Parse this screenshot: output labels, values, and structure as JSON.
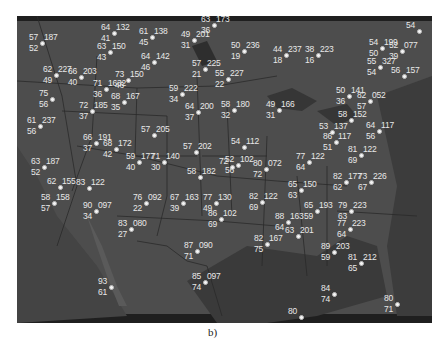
{
  "figure": {
    "caption": "b)",
    "background_color": "#4a4a4a",
    "text_color": "#e8e8e8"
  },
  "stations": [
    {
      "temp": "63",
      "pressure": "173",
      "dew": "36",
      "x": 210,
      "y": 18
    },
    {
      "temp": "57",
      "pressure": "187",
      "dew": "52",
      "x": 38,
      "y": 36
    },
    {
      "temp": "64",
      "pressure": "132",
      "dew": "41",
      "x": 110,
      "y": 26
    },
    {
      "temp": "61",
      "pressure": "138",
      "dew": "45",
      "x": 148,
      "y": 30
    },
    {
      "temp": "49",
      "pressure": "201",
      "dew": "31",
      "x": 190,
      "y": 33
    },
    {
      "temp": "63",
      "pressure": "150",
      "dew": "43",
      "x": 106,
      "y": 45
    },
    {
      "temp": "64",
      "pressure": "142",
      "dew": "46",
      "x": 150,
      "y": 55
    },
    {
      "temp": "50",
      "pressure": "236",
      "dew": "19",
      "x": 240,
      "y": 44
    },
    {
      "temp": "44",
      "pressure": "237",
      "dew": "18",
      "x": 282,
      "y": 48
    },
    {
      "temp": "38",
      "pressure": "223",
      "dew": "16",
      "x": 314,
      "y": 48
    },
    {
      "temp": "54",
      "pressure": "199",
      "dew": "50",
      "x": 378,
      "y": 41
    },
    {
      "temp": "52",
      "pressure": "077",
      "dew": "39",
      "x": 398,
      "y": 44
    },
    {
      "temp": "54",
      "pressure": "",
      "dew": "",
      "x": 415,
      "y": 24
    },
    {
      "temp": "55",
      "pressure": "327",
      "dew": "54",
      "x": 376,
      "y": 60
    },
    {
      "temp": "56",
      "pressure": "157",
      "dew": "",
      "x": 400,
      "y": 69
    },
    {
      "temp": "57",
      "pressure": "225",
      "dew": "21",
      "x": 201,
      "y": 62
    },
    {
      "temp": "55",
      "pressure": "227",
      "dew": "22",
      "x": 224,
      "y": 72
    },
    {
      "temp": "62",
      "pressure": "227",
      "dew": "49",
      "x": 52,
      "y": 68
    },
    {
      "temp": "66",
      "pressure": "203",
      "dew": "40",
      "x": 77,
      "y": 70
    },
    {
      "temp": "71",
      "pressure": "1632",
      "dew": "36",
      "x": 102,
      "y": 82
    },
    {
      "temp": "73",
      "pressure": "150",
      "dew": "46",
      "x": 124,
      "y": 73
    },
    {
      "temp": "68",
      "pressure": "167",
      "dew": "35",
      "x": 120,
      "y": 95
    },
    {
      "temp": "59",
      "pressure": "222",
      "dew": "34",
      "x": 178,
      "y": 87
    },
    {
      "temp": "64",
      "pressure": "200",
      "dew": "37",
      "x": 194,
      "y": 105
    },
    {
      "temp": "58",
      "pressure": "180",
      "dew": "32",
      "x": 230,
      "y": 103
    },
    {
      "temp": "49",
      "pressure": "166",
      "dew": "31",
      "x": 275,
      "y": 103
    },
    {
      "temp": "50",
      "pressure": "141",
      "dew": "36",
      "x": 345,
      "y": 89
    },
    {
      "temp": "82",
      "pressure": "052",
      "dew": "57",
      "x": 366,
      "y": 94
    },
    {
      "temp": "75",
      "pressure": "",
      "dew": "56",
      "x": 48,
      "y": 92
    },
    {
      "temp": "72",
      "pressure": "185",
      "dew": "37",
      "x": 88,
      "y": 104
    },
    {
      "temp": "61",
      "pressure": "237",
      "dew": "56",
      "x": 36,
      "y": 119
    },
    {
      "temp": "58",
      "pressure": "152",
      "dew": "",
      "x": 347,
      "y": 113
    },
    {
      "temp": "53",
      "pressure": "137",
      "dew": "",
      "x": 328,
      "y": 125
    },
    {
      "temp": "64",
      "pressure": "117",
      "dew": "56",
      "x": 375,
      "y": 124
    },
    {
      "temp": "86",
      "pressure": "117",
      "dew": "51",
      "x": 332,
      "y": 135
    },
    {
      "temp": "81",
      "pressure": "122",
      "dew": "69",
      "x": 357,
      "y": 148
    },
    {
      "temp": "57",
      "pressure": "205",
      "dew": "",
      "x": 150,
      "y": 128
    },
    {
      "temp": "66",
      "pressure": "191",
      "dew": "37",
      "x": 92,
      "y": 136
    },
    {
      "temp": "68",
      "pressure": "172",
      "dew": "42",
      "x": 112,
      "y": 142
    },
    {
      "temp": "54",
      "pressure": "112",
      "dew": "",
      "x": 240,
      "y": 140
    },
    {
      "temp": "57",
      "pressure": "202",
      "dew": "",
      "x": 192,
      "y": 145
    },
    {
      "temp": "59",
      "pressure": "177",
      "dew": "40",
      "x": 135,
      "y": 155
    },
    {
      "temp": "71",
      "pressure": "140",
      "dew": "30",
      "x": 160,
      "y": 155
    },
    {
      "temp": "63",
      "pressure": "187",
      "dew": "52",
      "x": 40,
      "y": 160
    },
    {
      "temp": "52",
      "pressure": "102",
      "dew": "56",
      "x": 234,
      "y": 158
    },
    {
      "temp": "72",
      "pressure": "",
      "dew": "",
      "x": 228,
      "y": 160
    },
    {
      "temp": "80",
      "pressure": "072",
      "dew": "72",
      "x": 262,
      "y": 162
    },
    {
      "temp": "77",
      "pressure": "122",
      "dew": "64",
      "x": 305,
      "y": 155
    },
    {
      "temp": "58",
      "pressure": "182",
      "dew": "",
      "x": 196,
      "y": 170
    },
    {
      "temp": "82",
      "pressure": "177",
      "dew": "62",
      "x": 342,
      "y": 175
    },
    {
      "temp": "73",
      "pressure": "226",
      "dew": "67",
      "x": 367,
      "y": 175
    },
    {
      "temp": "62",
      "pressure": "155",
      "dew": "",
      "x": 56,
      "y": 180
    },
    {
      "temp": "83",
      "pressure": "122",
      "dew": "",
      "x": 85,
      "y": 181
    },
    {
      "temp": "58",
      "pressure": "158",
      "dew": "57",
      "x": 50,
      "y": 196
    },
    {
      "temp": "65",
      "pressure": "150",
      "dew": "63",
      "x": 297,
      "y": 183
    },
    {
      "temp": "67",
      "pressure": "163",
      "dew": "39",
      "x": 179,
      "y": 196
    },
    {
      "temp": "77",
      "pressure": "130",
      "dew": "49",
      "x": 212,
      "y": 196
    },
    {
      "temp": "82",
      "pressure": "122",
      "dew": "69",
      "x": 258,
      "y": 195
    },
    {
      "temp": "76",
      "pressure": "092",
      "dew": "22",
      "x": 142,
      "y": 196
    },
    {
      "temp": "90",
      "pressure": "097",
      "dew": "34",
      "x": 92,
      "y": 204
    },
    {
      "temp": "65",
      "pressure": "193",
      "dew": "59",
      "x": 313,
      "y": 204
    },
    {
      "temp": "79",
      "pressure": "223",
      "dew": "63",
      "x": 347,
      "y": 204
    },
    {
      "temp": "88",
      "pressure": "163",
      "dew": "64",
      "x": 284,
      "y": 215
    },
    {
      "temp": "86",
      "pressure": "102",
      "dew": "69",
      "x": 217,
      "y": 212
    },
    {
      "temp": "77",
      "pressure": "223",
      "dew": "64",
      "x": 346,
      "y": 222
    },
    {
      "temp": "63",
      "pressure": "201",
      "dew": "",
      "x": 294,
      "y": 229
    },
    {
      "temp": "83",
      "pressure": "080",
      "dew": "27",
      "x": 127,
      "y": 222
    },
    {
      "temp": "82",
      "pressure": "167",
      "dew": "75",
      "x": 263,
      "y": 237
    },
    {
      "temp": "89",
      "pressure": "203",
      "dew": "59",
      "x": 330,
      "y": 245
    },
    {
      "temp": "87",
      "pressure": "090",
      "dew": "71",
      "x": 193,
      "y": 244
    },
    {
      "temp": "81",
      "pressure": "212",
      "dew": "65",
      "x": 357,
      "y": 256
    },
    {
      "temp": "85",
      "pressure": "097",
      "dew": "74",
      "x": 201,
      "y": 275
    },
    {
      "temp": "84",
      "pressure": "",
      "dew": "74",
      "x": 330,
      "y": 287
    },
    {
      "temp": "80",
      "pressure": "",
      "dew": "71",
      "x": 393,
      "y": 297
    },
    {
      "temp": "93",
      "pressure": "",
      "dew": "61",
      "x": 107,
      "y": 280
    },
    {
      "temp": "80",
      "pressure": "",
      "dew": "",
      "x": 297,
      "y": 310
    }
  ]
}
